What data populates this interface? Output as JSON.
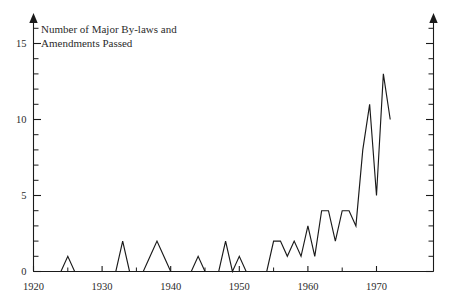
{
  "chart_data": {
    "type": "line",
    "title": "",
    "axis_title_lines": [
      "Number of Major By-laws and",
      "Amendments Passed"
    ],
    "ylabel": "Number of Major By-laws and Amendments Passed",
    "xlabel": "",
    "xlim": [
      1920,
      1973
    ],
    "ylim": [
      0,
      16
    ],
    "x_tick_labels": [
      "1920",
      "1930",
      "1940",
      "1950",
      "1960",
      "1970"
    ],
    "x_tick_values": [
      1920,
      1930,
      1940,
      1950,
      1960,
      1970
    ],
    "x_minor_tick_interval": 5,
    "y_tick_labels": [
      "0",
      "5",
      "10",
      "15"
    ],
    "y_tick_values": [
      0,
      5,
      10,
      15
    ],
    "y_minor_tick_interval": 1,
    "grid": false,
    "legend": "none",
    "line_color": "#1a1a1a",
    "background_color": "#ffffff",
    "x": [
      1920,
      1921,
      1922,
      1923,
      1924,
      1925,
      1926,
      1927,
      1928,
      1929,
      1930,
      1931,
      1932,
      1933,
      1934,
      1935,
      1936,
      1937,
      1938,
      1939,
      1940,
      1941,
      1942,
      1943,
      1944,
      1945,
      1946,
      1947,
      1948,
      1949,
      1950,
      1951,
      1952,
      1953,
      1954,
      1955,
      1956,
      1957,
      1958,
      1959,
      1960,
      1961,
      1962,
      1963,
      1964,
      1965,
      1966,
      1967,
      1968,
      1969,
      1970,
      1971,
      1972
    ],
    "values": [
      0,
      0,
      0,
      0,
      0,
      1,
      0,
      0,
      0,
      0,
      0,
      0,
      0,
      2,
      0,
      0,
      0,
      1,
      2,
      1,
      0,
      0,
      0,
      0,
      1,
      0,
      0,
      0,
      2,
      0,
      1,
      0,
      0,
      0,
      0,
      2,
      2,
      1,
      2,
      1,
      3,
      1,
      4,
      4,
      2,
      4,
      4,
      3,
      8,
      11,
      5,
      13,
      10
    ],
    "series": [
      {
        "name": "Major By-laws and Amendments Passed",
        "values": [
          0,
          0,
          0,
          0,
          0,
          1,
          0,
          0,
          0,
          0,
          0,
          0,
          0,
          2,
          0,
          0,
          0,
          1,
          2,
          1,
          0,
          0,
          0,
          0,
          1,
          0,
          0,
          0,
          2,
          0,
          1,
          0,
          0,
          0,
          0,
          2,
          2,
          1,
          2,
          1,
          3,
          1,
          4,
          4,
          2,
          4,
          4,
          3,
          8,
          11,
          5,
          13,
          10
        ]
      }
    ]
  }
}
